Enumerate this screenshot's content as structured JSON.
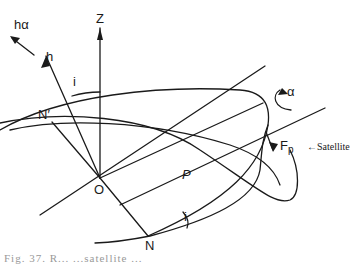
{
  "figure": {
    "labels": {
      "h_alpha": "hα",
      "h": "h",
      "z": "Z",
      "i_top": "i",
      "alpha": "α",
      "n_prime": "N′",
      "fp_main": "F",
      "fp_sub": "p",
      "satellite": "←Satellite",
      "o": "O",
      "p": "P",
      "i_bottom": "i",
      "n": "N"
    },
    "caption": "Fig. 37.   R...   ...satellite   ..."
  }
}
